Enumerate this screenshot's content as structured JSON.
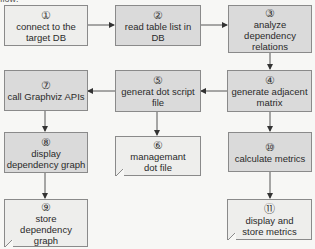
{
  "header_fragment": "flow:",
  "nodes": [
    {
      "id": "n1",
      "num": "①",
      "label": "connect to the target DB"
    },
    {
      "id": "n2",
      "num": "②",
      "label": "read table list in DB"
    },
    {
      "id": "n3",
      "num": "③",
      "label": "analyze dependency relations"
    },
    {
      "id": "n4",
      "num": "④",
      "label": "generate adjacent matrix"
    },
    {
      "id": "n5",
      "num": "⑤",
      "label": "generat dot script file"
    },
    {
      "id": "n6",
      "num": "⑥",
      "label": "managemant dot file"
    },
    {
      "id": "n7",
      "num": "⑦",
      "label": "call Graphviz APIs"
    },
    {
      "id": "n8",
      "num": "⑧",
      "label": "display dependency graph"
    },
    {
      "id": "n9",
      "num": "⑨",
      "label": "store dependency graph"
    },
    {
      "id": "n10",
      "num": "⑩",
      "label": "calculate metrics"
    },
    {
      "id": "n11",
      "num": "⑪",
      "label": "display and store metrics"
    }
  ],
  "edges": [
    {
      "from": "n1",
      "to": "n2"
    },
    {
      "from": "n2",
      "to": "n3"
    },
    {
      "from": "n3",
      "to": "n4"
    },
    {
      "from": "n4",
      "to": "n5"
    },
    {
      "from": "n5",
      "to": "n7"
    },
    {
      "from": "n5",
      "to": "n6"
    },
    {
      "from": "n7",
      "to": "n8"
    },
    {
      "from": "n8",
      "to": "n9"
    },
    {
      "from": "n4",
      "to": "n10"
    },
    {
      "from": "n10",
      "to": "n11"
    }
  ],
  "colors": {
    "box_fill": "#dadada",
    "box_fill_light": "#eeeeec",
    "border": "#8a8a8a",
    "arrow": "#333333"
  }
}
